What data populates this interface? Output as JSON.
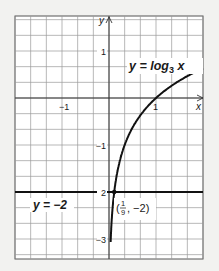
{
  "chart_data": {
    "type": "line",
    "title": "",
    "xlabel": "x",
    "ylabel": "y",
    "xlim": [
      -2,
      2
    ],
    "ylim": [
      -3.35,
      1.75
    ],
    "grid": true,
    "grid_step": 0.3333,
    "x_ticks": [
      {
        "value": -1,
        "label": "−1"
      },
      {
        "value": 1,
        "label": "1"
      }
    ],
    "y_ticks": [
      {
        "value": 1,
        "label": "1"
      },
      {
        "value": -1,
        "label": "−1"
      },
      {
        "value": -2,
        "label": "2"
      },
      {
        "value": -3,
        "label": "−3"
      }
    ],
    "series": [
      {
        "name": "y = log3 x",
        "label_main": "y = log",
        "label_sub": "3",
        "label_var": " x",
        "function": "log3(x)",
        "x": [
          0.037,
          0.0556,
          0.0833,
          0.1111,
          0.2,
          0.3333,
          0.5,
          0.75,
          1,
          1.5,
          2
        ],
        "values": [
          -3.0,
          -2.63,
          -2.26,
          -2.0,
          -1.46,
          -1.0,
          -0.63,
          -0.26,
          0.0,
          0.37,
          0.63
        ]
      },
      {
        "name": "y = −2",
        "label": "y = −2",
        "function": "constant",
        "x": [
          -2,
          2
        ],
        "values": [
          -2,
          -2
        ]
      }
    ],
    "annotations": [
      {
        "type": "point",
        "x": 0.1111,
        "y": -2,
        "label_open": "(",
        "label_num": "1",
        "label_den": "9",
        "label_close": ", −2)"
      }
    ],
    "colors": {
      "grid": "#9a9a9a",
      "axis": "#1a1a1a",
      "curve": "#111111",
      "background": "#ffffff"
    }
  }
}
